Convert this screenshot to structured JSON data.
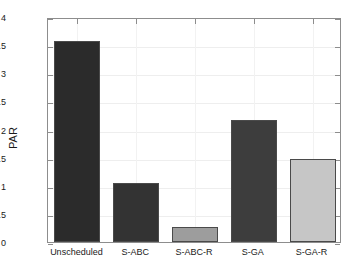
{
  "chart_data": {
    "type": "bar",
    "title": "",
    "xlabel": "",
    "ylabel": "PAR",
    "ylim": [
      0,
      4
    ],
    "yticks": [
      0,
      0.5,
      1,
      1.5,
      2,
      2.5,
      3,
      3.5,
      4
    ],
    "ytick_labels": [
      "0",
      "0.5",
      "1",
      "1.5",
      "2",
      "2.5",
      "3",
      "3.5",
      "4"
    ],
    "grid": true,
    "legend": null,
    "categories": [
      "Unscheduled",
      "S-ABC",
      "S-ABC-R",
      "S-GA",
      "S-GA-R"
    ],
    "values": [
      3.58,
      1.05,
      0.27,
      2.17,
      1.47
    ],
    "bar_colors": [
      "#2b2b2b",
      "#333333",
      "#9d9d9d",
      "#3d3d3d",
      "#c6c6c6"
    ],
    "bar_edge_color": "#4a4a4a"
  },
  "axis": {
    "y_title": "PAR"
  }
}
